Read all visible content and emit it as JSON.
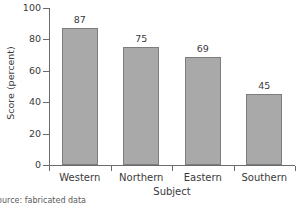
{
  "chart_data": {
    "type": "bar",
    "title": "",
    "categories": [
      "Western",
      "Northern",
      "Eastern",
      "Southern"
    ],
    "values": [
      87,
      75,
      69,
      45
    ],
    "value_labels": [
      "87",
      "75",
      "69",
      "45"
    ],
    "xlabel": "Subject",
    "ylabel": "Score (percent)",
    "ylim": [
      0,
      100
    ],
    "yticks": [
      0,
      20,
      40,
      60,
      80,
      100
    ],
    "ytick_labels": [
      "0",
      "20",
      "40",
      "60",
      "80",
      "100"
    ],
    "grid": false,
    "legend": false,
    "legend_position": "none",
    "bar_color": "#a9a9a9",
    "bar_edge_color": "#7d7d7d",
    "axis_color": "#6b6b6b",
    "text_color": "#3a3a3a"
  },
  "caption": {
    "text": "Source: fabricated data"
  }
}
